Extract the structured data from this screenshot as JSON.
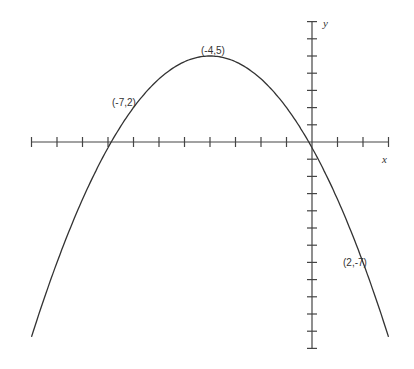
{
  "chart_data": {
    "type": "line",
    "title": "",
    "xlabel": "x",
    "ylabel": "y",
    "xlim": [
      -11,
      3
    ],
    "ylim": [
      -12,
      7
    ],
    "grid": false,
    "equation": "y = -(1/3)(x+4)^2 + 5",
    "series": [
      {
        "name": "parabola",
        "x": [
          -11,
          -10,
          -9,
          -8,
          -7,
          -6,
          -5,
          -4,
          -3,
          -2,
          -1,
          0,
          1,
          2,
          3
        ],
        "values": [
          -11.33,
          -7,
          -3.33,
          -0.33,
          2,
          3.67,
          4.67,
          5,
          4.67,
          3.67,
          2,
          -0.33,
          -3.33,
          -7,
          -11.33
        ]
      }
    ],
    "annotations": [
      {
        "text": "(-4,5)",
        "x": -4,
        "y": 5
      },
      {
        "text": "(-7,2)",
        "x": -7,
        "y": 2
      },
      {
        "text": "(2,-7)",
        "x": 2,
        "y": -7
      }
    ]
  },
  "labels": {
    "x": "x",
    "y": "y",
    "a1": "(-4,5)",
    "a2": "(-7,2)",
    "a3": "(2,-7)"
  }
}
